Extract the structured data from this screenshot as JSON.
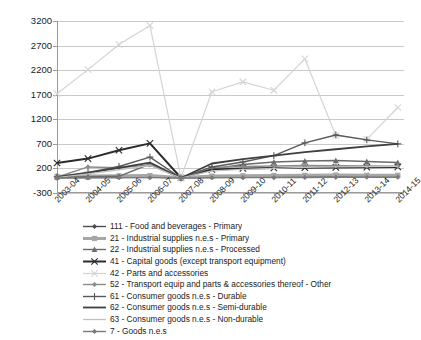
{
  "chart_data": {
    "type": "line",
    "title": "",
    "xlabel": "",
    "ylabel": "",
    "ylim": [
      -300,
      3200
    ],
    "yticks": [
      -300,
      200,
      700,
      1200,
      1700,
      2200,
      2700,
      3200
    ],
    "grid": true,
    "legend_position": "below",
    "categories": [
      "2003-04",
      "2004-05",
      "2005-06",
      "2006-07",
      "2007-08",
      "2008-09",
      "2009-10",
      "2010-11",
      "2011-12",
      "2012-13",
      "2013-14",
      "2014-15"
    ],
    "series": [
      {
        "code": "111",
        "name": "111 - Food and beverages - Primary",
        "color": "#4d4d4d",
        "marker": "diamond",
        "width": 1.4,
        "values": [
          10,
          15,
          20,
          25,
          5,
          20,
          25,
          30,
          35,
          40,
          45,
          50
        ]
      },
      {
        "code": "21",
        "name": "21 -  Industrial supplies n.e.s - Primary",
        "color": "#a6a6a6",
        "marker": "square",
        "width": 3.0,
        "values": [
          40,
          45,
          50,
          55,
          10,
          45,
          50,
          55,
          60,
          65,
          60,
          60
        ]
      },
      {
        "code": "22",
        "name": "22 - Industrial supplies n.e.s - Processed",
        "color": "#6b6b6b",
        "marker": "triangle",
        "width": 1.4,
        "values": [
          20,
          30,
          40,
          290,
          5,
          190,
          280,
          330,
          350,
          360,
          340,
          320
        ]
      },
      {
        "code": "41",
        "name": "41 - Capital goods (except transport equipment)",
        "color": "#2b2b2b",
        "marker": "cross",
        "width": 2.0,
        "values": [
          310,
          400,
          570,
          710,
          10,
          180,
          200,
          210,
          215,
          220,
          225,
          230
        ]
      },
      {
        "code": "42",
        "name": "42 - Parts and accessories",
        "color": "#d4d4d4",
        "marker": "cross",
        "width": 1.2,
        "values": [
          1720,
          2210,
          2720,
          3110,
          10,
          1760,
          1960,
          1790,
          2430,
          870,
          790,
          1440
        ]
      },
      {
        "code": "52",
        "name": "52 - Transport equip and parts & accessories thereof - Other",
        "color": "#8c8c8c",
        "marker": "diamond",
        "width": 1.4,
        "values": [
          20,
          230,
          215,
          270,
          5,
          220,
          240,
          250,
          260,
          255,
          250,
          245
        ]
      },
      {
        "code": "61",
        "name": "61 -  Consumer goods n.e.s - Durable",
        "color": "#595959",
        "marker": "plus",
        "width": 1.4,
        "values": [
          30,
          120,
          240,
          430,
          5,
          230,
          330,
          460,
          720,
          880,
          780,
          700
        ]
      },
      {
        "code": "62",
        "name": "62 - Consumer goods n.e.s - Semi-durable",
        "color": "#3f3f3f",
        "marker": "none",
        "width": 1.8,
        "values": [
          20,
          110,
          210,
          320,
          5,
          300,
          390,
          460,
          530,
          590,
          650,
          700
        ]
      },
      {
        "code": "63",
        "name": "63 - Consumer goods n.e.s - Non-durable",
        "color": "#c2c2c2",
        "marker": "none",
        "width": 1.2,
        "values": [
          15,
          90,
          170,
          260,
          5,
          150,
          180,
          200,
          220,
          230,
          235,
          240
        ]
      },
      {
        "code": "7",
        "name": "7 - Goods n.e.s",
        "color": "#7a7a7a",
        "marker": "diamond",
        "width": 1.4,
        "values": [
          5,
          8,
          10,
          12,
          2,
          10,
          12,
          14,
          16,
          18,
          20,
          22
        ]
      }
    ]
  }
}
